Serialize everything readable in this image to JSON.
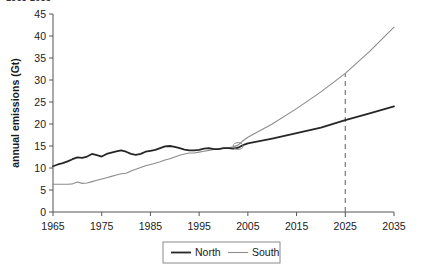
{
  "figure": {
    "clipped_heading": "1965-2035"
  },
  "chart_data": {
    "type": "line",
    "title": "",
    "subtitle": "",
    "xlabel": "",
    "ylabel": "annual emissions (Gt)",
    "xlim": [
      1965,
      2035
    ],
    "ylim": [
      0,
      45
    ],
    "x_ticks": [
      1965,
      1975,
      1985,
      1995,
      2005,
      2015,
      2025,
      2035
    ],
    "y_ticks": [
      0,
      5,
      10,
      15,
      20,
      25,
      30,
      35,
      40,
      45
    ],
    "grid": false,
    "legend_position": "bottom-center",
    "legend": [
      "North",
      "South"
    ],
    "colors": {
      "north": "#262626",
      "south": "#8c8c8c",
      "axis": "#555555",
      "marker": "#8c8c8c",
      "background": "#ffffff"
    },
    "series": [
      {
        "name": "North",
        "color": "#262626",
        "x": [
          1965,
          1966,
          1967,
          1968,
          1969,
          1970,
          1971,
          1972,
          1973,
          1974,
          1975,
          1976,
          1977,
          1978,
          1979,
          1980,
          1981,
          1982,
          1983,
          1984,
          1985,
          1986,
          1987,
          1988,
          1989,
          1990,
          1991,
          1992,
          1993,
          1994,
          1995,
          1996,
          1997,
          1998,
          1999,
          2000,
          2001,
          2002,
          2003,
          2004,
          2005,
          2010,
          2015,
          2020,
          2025,
          2030,
          2035
        ],
        "values": [
          10.4,
          10.8,
          11.1,
          11.5,
          12.0,
          12.4,
          12.3,
          12.6,
          13.2,
          12.9,
          12.6,
          13.2,
          13.5,
          13.8,
          14.0,
          13.7,
          13.2,
          13.0,
          13.2,
          13.7,
          13.9,
          14.1,
          14.5,
          14.9,
          15.0,
          14.8,
          14.5,
          14.2,
          14.0,
          14.0,
          14.1,
          14.4,
          14.5,
          14.3,
          14.3,
          14.5,
          14.5,
          14.4,
          14.6,
          15.2,
          15.6,
          16.7,
          17.9,
          19.2,
          20.9,
          22.4,
          24.0
        ]
      },
      {
        "name": "South",
        "color": "#8c8c8c",
        "x": [
          1965,
          1966,
          1967,
          1968,
          1969,
          1970,
          1971,
          1972,
          1973,
          1974,
          1975,
          1976,
          1977,
          1978,
          1979,
          1980,
          1981,
          1982,
          1983,
          1984,
          1985,
          1986,
          1987,
          1988,
          1989,
          1990,
          1991,
          1992,
          1993,
          1994,
          1995,
          1996,
          1997,
          1998,
          1999,
          2000,
          2001,
          2002,
          2003,
          2004,
          2005,
          2010,
          2015,
          2020,
          2025,
          2030,
          2035
        ],
        "values": [
          6.3,
          6.3,
          6.3,
          6.3,
          6.4,
          6.8,
          6.5,
          6.6,
          6.9,
          7.2,
          7.5,
          7.8,
          8.1,
          8.4,
          8.7,
          8.8,
          9.3,
          9.7,
          10.1,
          10.5,
          10.8,
          11.1,
          11.4,
          11.8,
          12.1,
          12.5,
          12.9,
          13.2,
          13.4,
          13.4,
          13.6,
          13.8,
          14.0,
          14.2,
          14.3,
          14.5,
          14.6,
          14.8,
          15.2,
          16.2,
          17.0,
          20.0,
          23.5,
          27.3,
          31.5,
          36.5,
          42.0
        ]
      }
    ],
    "annotations": [
      {
        "type": "vertical-dashed-line",
        "x": 2025,
        "y_from": 0,
        "y_to": 31.5,
        "label": "2025"
      },
      {
        "type": "crossover-marker",
        "x": 2003,
        "y": 15.0
      }
    ]
  }
}
